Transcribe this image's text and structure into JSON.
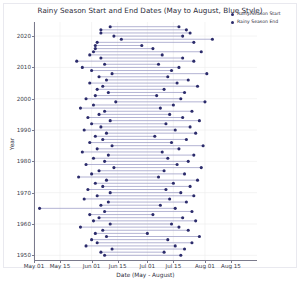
{
  "chart_data": {
    "type": "scatter",
    "title": "Rainy Season Start and End Dates (May to August, Blue Style)",
    "xlabel": "Date (May - August)",
    "ylabel": "Year",
    "grid": true,
    "legend_position": "upper right",
    "xlim": [
      0,
      120
    ],
    "ylim": [
      1948.5,
      2024.5
    ],
    "x_tick_labels": [
      "May 01",
      "May 15",
      "Jun 01",
      "Jun 15",
      "Jul 01",
      "Jul 15",
      "Aug 01",
      "Aug 15"
    ],
    "x_tick_values": [
      0,
      14,
      31,
      45,
      61,
      75,
      92,
      106
    ],
    "y_tick_labels": [
      "1950",
      "1960",
      "1970",
      "1980",
      "1990",
      "2000",
      "2010",
      "2020"
    ],
    "y_tick_values": [
      1950,
      1960,
      1970,
      1980,
      1990,
      2000,
      2010,
      2020
    ],
    "colors": {
      "start_marker": "#2b2b6b",
      "end_marker": "#2b2b6b",
      "connector_line": "#9a9ac4",
      "grid": "#ececed",
      "axis": "#7a7a8c",
      "text": "#2c2c3a",
      "background": "#ffffff"
    },
    "series": [
      {
        "name": "Rainy Season Start",
        "marker": "circle",
        "color": "#2b2b6b"
      },
      {
        "name": "Rainy Season End",
        "marker": "circle",
        "color": "#2b2b6b"
      }
    ],
    "records": [
      {
        "year": 2023,
        "start": 41,
        "end": 78
      },
      {
        "year": 2022,
        "start": 36,
        "end": 82
      },
      {
        "year": 2021,
        "start": 36,
        "end": 84
      },
      {
        "year": 2020,
        "start": 43,
        "end": 80
      },
      {
        "year": 2019,
        "start": 47,
        "end": 96
      },
      {
        "year": 2018,
        "start": 34,
        "end": 86
      },
      {
        "year": 2017,
        "start": 33,
        "end": 58
      },
      {
        "year": 2016,
        "start": 33,
        "end": 64
      },
      {
        "year": 2015,
        "start": 32,
        "end": 90
      },
      {
        "year": 2014,
        "start": 30,
        "end": 69
      },
      {
        "year": 2013,
        "start": 36,
        "end": 80
      },
      {
        "year": 2012,
        "start": 23,
        "end": 86
      },
      {
        "year": 2011,
        "start": 38,
        "end": 67
      },
      {
        "year": 2010,
        "start": 26,
        "end": 78
      },
      {
        "year": 2009,
        "start": 31,
        "end": 74
      },
      {
        "year": 2008,
        "start": 42,
        "end": 93
      },
      {
        "year": 2007,
        "start": 35,
        "end": 72
      },
      {
        "year": 2006,
        "start": 39,
        "end": 83
      },
      {
        "year": 2005,
        "start": 30,
        "end": 77
      },
      {
        "year": 2004,
        "start": 37,
        "end": 88
      },
      {
        "year": 2003,
        "start": 34,
        "end": 70
      },
      {
        "year": 2002,
        "start": 40,
        "end": 81
      },
      {
        "year": 2001,
        "start": 33,
        "end": 66
      },
      {
        "year": 2000,
        "start": 28,
        "end": 79
      },
      {
        "year": 1999,
        "start": 44,
        "end": 92
      },
      {
        "year": 1998,
        "start": 32,
        "end": 75
      },
      {
        "year": 1997,
        "start": 25,
        "end": 68
      },
      {
        "year": 1996,
        "start": 38,
        "end": 85
      },
      {
        "year": 1995,
        "start": 35,
        "end": 73
      },
      {
        "year": 1994,
        "start": 29,
        "end": 80
      },
      {
        "year": 1993,
        "start": 41,
        "end": 89
      },
      {
        "year": 1992,
        "start": 31,
        "end": 71
      },
      {
        "year": 1991,
        "start": 36,
        "end": 84
      },
      {
        "year": 1990,
        "start": 27,
        "end": 76
      },
      {
        "year": 1989,
        "start": 39,
        "end": 87
      },
      {
        "year": 1988,
        "start": 33,
        "end": 65
      },
      {
        "year": 1987,
        "start": 37,
        "end": 82
      },
      {
        "year": 1986,
        "start": 30,
        "end": 74
      },
      {
        "year": 1985,
        "start": 42,
        "end": 91
      },
      {
        "year": 1984,
        "start": 34,
        "end": 78
      },
      {
        "year": 1983,
        "start": 26,
        "end": 69
      },
      {
        "year": 1982,
        "start": 40,
        "end": 86
      },
      {
        "year": 1981,
        "start": 32,
        "end": 72
      },
      {
        "year": 1980,
        "start": 38,
        "end": 83
      },
      {
        "year": 1979,
        "start": 28,
        "end": 77
      },
      {
        "year": 1978,
        "start": 43,
        "end": 90
      },
      {
        "year": 1977,
        "start": 35,
        "end": 70
      },
      {
        "year": 1976,
        "start": 31,
        "end": 81
      },
      {
        "year": 1975,
        "start": 24,
        "end": 67
      },
      {
        "year": 1974,
        "start": 39,
        "end": 88
      },
      {
        "year": 1973,
        "start": 33,
        "end": 75
      },
      {
        "year": 1972,
        "start": 37,
        "end": 84
      },
      {
        "year": 1971,
        "start": 29,
        "end": 71
      },
      {
        "year": 1970,
        "start": 41,
        "end": 79
      },
      {
        "year": 1969,
        "start": 34,
        "end": 86
      },
      {
        "year": 1968,
        "start": 27,
        "end": 73
      },
      {
        "year": 1967,
        "start": 40,
        "end": 82
      },
      {
        "year": 1966,
        "start": 36,
        "end": 68
      },
      {
        "year": 1965,
        "start": 3,
        "end": 76
      },
      {
        "year": 1964,
        "start": 38,
        "end": 85
      },
      {
        "year": 1963,
        "start": 30,
        "end": 64
      },
      {
        "year": 1962,
        "start": 35,
        "end": 80
      },
      {
        "year": 1961,
        "start": 32,
        "end": 87
      },
      {
        "year": 1960,
        "start": 41,
        "end": 74
      },
      {
        "year": 1959,
        "start": 25,
        "end": 78
      },
      {
        "year": 1958,
        "start": 37,
        "end": 83
      },
      {
        "year": 1957,
        "start": 33,
        "end": 61
      },
      {
        "year": 1956,
        "start": 39,
        "end": 89
      },
      {
        "year": 1955,
        "start": 31,
        "end": 72
      },
      {
        "year": 1954,
        "start": 34,
        "end": 85
      },
      {
        "year": 1953,
        "start": 28,
        "end": 76
      },
      {
        "year": 1952,
        "start": 42,
        "end": 81
      },
      {
        "year": 1951,
        "start": 36,
        "end": 70
      },
      {
        "year": 1950,
        "start": 38,
        "end": 79
      }
    ]
  }
}
